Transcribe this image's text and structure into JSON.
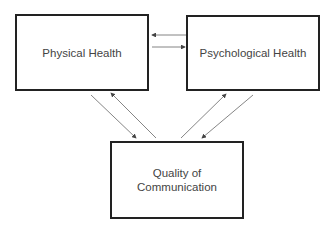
{
  "diagram": {
    "nodes": [
      {
        "id": "physical",
        "label": "Physical Health"
      },
      {
        "id": "psychological",
        "label": "Psychological Health"
      },
      {
        "id": "communication",
        "label_line1": "Quality of",
        "label_line2": "Communication"
      }
    ],
    "edges": [
      {
        "from": "psychological",
        "to": "physical"
      },
      {
        "from": "physical",
        "to": "psychological"
      },
      {
        "from": "physical",
        "to": "communication"
      },
      {
        "from": "communication",
        "to": "physical"
      },
      {
        "from": "communication",
        "to": "psychological"
      },
      {
        "from": "psychological",
        "to": "communication"
      }
    ],
    "colors": {
      "line": "#555555",
      "border": "#222222",
      "text": "#444444"
    }
  }
}
